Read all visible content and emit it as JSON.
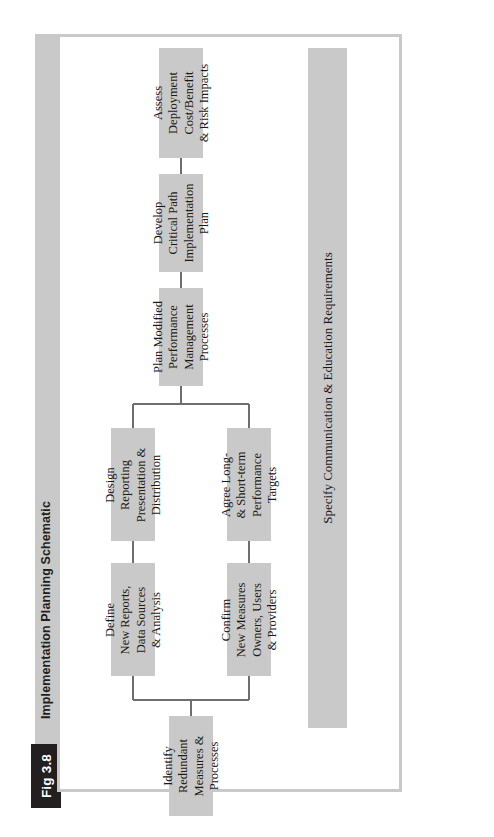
{
  "figure": {
    "number_label": "Fig 3.8",
    "title": "Implementation Planning Schematic"
  },
  "diagram": {
    "type": "flowchart",
    "orientation": "right-to-left rotated (text reads bottom-to-top)",
    "banner": {
      "label": "Specify Communication & Education Requirements"
    },
    "nodes": [
      {
        "id": "assess-deployment",
        "lines": [
          "Assess",
          "Deployment",
          "Cost/Benefit",
          "& Risk Impacts"
        ]
      },
      {
        "id": "develop-critical-path",
        "lines": [
          "Develop",
          "Critical Path",
          "Implementation",
          "Plan"
        ]
      },
      {
        "id": "plan-modified-performance",
        "lines": [
          "Plan Modified",
          "Performance",
          "Management",
          "Processes"
        ]
      },
      {
        "id": "design-reporting",
        "lines": [
          "Design",
          "Reporting",
          "Presentation &",
          "Distribution"
        ]
      },
      {
        "id": "agree-targets",
        "lines": [
          "Agree Long-",
          "& Short-term",
          "Performance",
          "Targets"
        ]
      },
      {
        "id": "define-new-reports",
        "lines": [
          "Define",
          "New Reports,",
          "Data Sources",
          "& Analysis"
        ]
      },
      {
        "id": "confirm-new-measures",
        "lines": [
          "Confirm",
          "New Measures",
          "Owners, Users",
          "& Providers"
        ]
      },
      {
        "id": "identify-redundant",
        "lines": [
          "Identify",
          "Redundant",
          "Measures &",
          "Processes"
        ]
      }
    ],
    "colors": {
      "box_fill": "#c9c9c9",
      "frame_border": "#c9c9c9",
      "connector": "#6e6e6e",
      "label_box_fill": "#231f20",
      "label_box_text": "#ffffff",
      "text": "#1a1a1a",
      "page_background": "#ffffff"
    }
  }
}
